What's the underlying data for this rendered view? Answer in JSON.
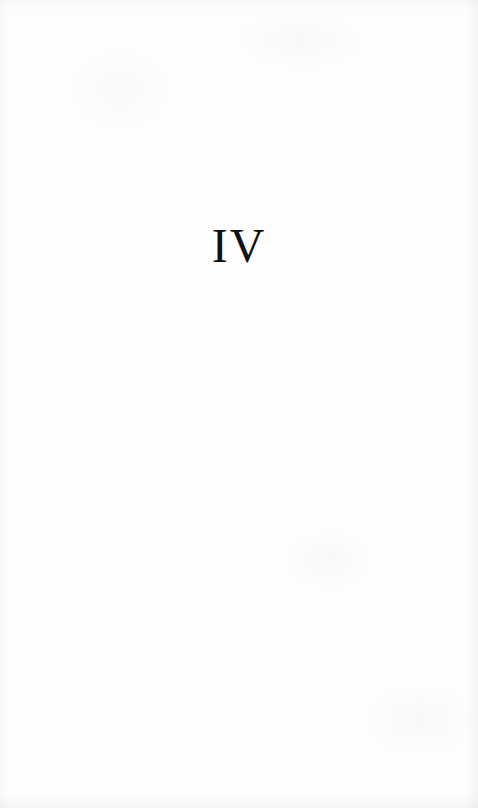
{
  "page": {
    "type": "part-title-page",
    "numeral": "IV",
    "colors": {
      "paper": "#fdfdfd",
      "ink": "#111111"
    }
  }
}
